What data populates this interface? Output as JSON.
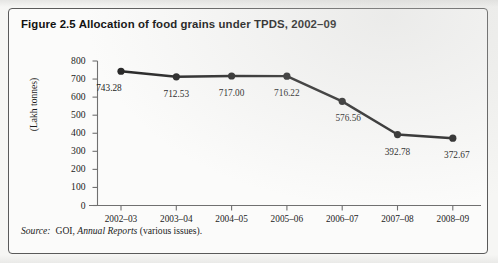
{
  "figure": {
    "title": "Figure 2.5 Allocation of food grains under TPDS, 2002–09",
    "source_prefix": "Source:",
    "source_agency": "GOI,",
    "source_publication": "Annual Reports",
    "source_suffix": "(various issues)."
  },
  "chart_data": {
    "type": "line",
    "title": "Figure 2.5 Allocation of food grains under TPDS, 2002–09",
    "xlabel": "",
    "ylabel": "(Lakh tonnes)",
    "categories": [
      "2002–03",
      "2003–04",
      "2004–05",
      "2005–06",
      "2006–07",
      "2007–08",
      "2008–09"
    ],
    "values": [
      743.28,
      712.53,
      717.0,
      716.22,
      576.56,
      392.78,
      372.67
    ],
    "point_labels": [
      "743.28",
      "712.53",
      "717.00",
      "716.22",
      "576.56",
      "392.78",
      "372.67"
    ],
    "ylim": [
      0,
      800
    ],
    "yticks": [
      800,
      700,
      600,
      500,
      400,
      300,
      200,
      100,
      0
    ],
    "ytick_labels": [
      "800",
      "700",
      "600",
      "500",
      "400",
      "300",
      "200",
      "100",
      "0"
    ],
    "grid": false,
    "legend": null,
    "series_color": "#262626",
    "axis_color": "#707070",
    "marker": "circle"
  }
}
